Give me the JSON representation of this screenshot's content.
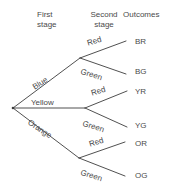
{
  "diagram": {
    "background_color": "#ffffff",
    "line_color": "#3c3c3c",
    "text_color": "#4a4a4a",
    "headers": {
      "first_stage_line1": "First",
      "first_stage_line2": "stage",
      "second_stage_line1": "Second",
      "second_stage_line2": "stage",
      "outcomes": "Outcomes"
    },
    "first_stage_branches": [
      {
        "label": "Blue",
        "rotation_deg": -33
      },
      {
        "label": "Yellow",
        "rotation_deg": 0
      },
      {
        "label": "Orange",
        "rotation_deg": 33
      }
    ],
    "second_stage_branches": [
      {
        "label": "Red",
        "rotation_deg": -17,
        "parent": "Blue"
      },
      {
        "label": "Green",
        "rotation_deg": 17,
        "parent": "Blue"
      },
      {
        "label": "Red",
        "rotation_deg": -17,
        "parent": "Yellow"
      },
      {
        "label": "Green",
        "rotation_deg": 17,
        "parent": "Yellow"
      },
      {
        "label": "Red",
        "rotation_deg": -17,
        "parent": "Orange"
      },
      {
        "label": "Green",
        "rotation_deg": 17,
        "parent": "Orange"
      }
    ],
    "outcomes": [
      {
        "label": "BR",
        "path": "Blue-Red"
      },
      {
        "label": "BG",
        "path": "Blue-Green"
      },
      {
        "label": "YR",
        "path": "Yellow-Red"
      },
      {
        "label": "YG",
        "path": "Yellow-Green"
      },
      {
        "label": "OR",
        "path": "Orange-Red"
      },
      {
        "label": "OG",
        "path": "Orange-Green"
      }
    ]
  }
}
